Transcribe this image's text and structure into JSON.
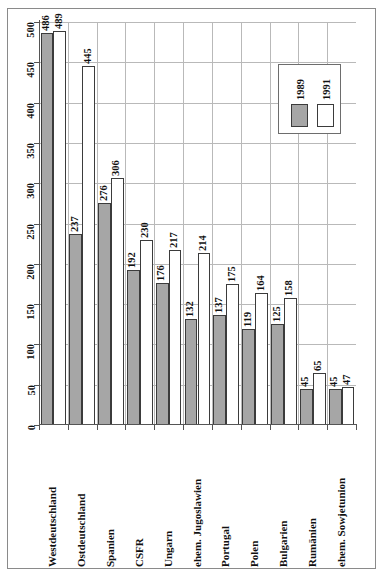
{
  "chart_data": {
    "type": "bar",
    "title": "",
    "xlabel": "",
    "ylabel": "",
    "ylim": [
      0,
      500
    ],
    "ytick_step": 50,
    "yticks": [
      "0",
      "50",
      "100",
      "150",
      "200",
      "250",
      "300",
      "350",
      "400",
      "450",
      "500"
    ],
    "grid": true,
    "legend_position": "top-right",
    "categories": [
      "Westdeutschland",
      "Ostdeutschland",
      "Spanien",
      "CSFR",
      "Ungarn",
      "ehem. Jugoslawien",
      "Portugal",
      "Polen",
      "Bulgarien",
      "Rumänien",
      "ehem. Sowjetunion"
    ],
    "series": [
      {
        "name": "1989",
        "color": "#a6a6a6",
        "values": [
          486,
          237,
          276,
          192,
          176,
          132,
          137,
          119,
          125,
          45,
          45
        ]
      },
      {
        "name": "1991",
        "color": "#ffffff",
        "values": [
          489,
          445,
          306,
          230,
          217,
          214,
          175,
          164,
          158,
          65,
          47
        ]
      }
    ]
  },
  "legend": {
    "entries": [
      {
        "label": "1989",
        "swatch": "gray-filled"
      },
      {
        "label": "1991",
        "swatch": "white-outlined"
      }
    ]
  },
  "colors": {
    "series_1989": "#a6a6a6",
    "series_1991": "#ffffff",
    "bar_outline": "#3b3b3b",
    "gridline": "#b9b9b9",
    "axis": "#555555",
    "frame": "#8a8a8a",
    "text": "#111111"
  }
}
